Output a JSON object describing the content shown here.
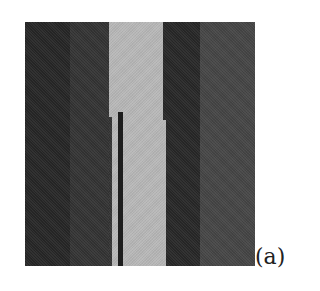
{
  "figure": {
    "label": "(a)",
    "regions": [
      {
        "name": "far-left-dark",
        "color": "#262626"
      },
      {
        "name": "left-dark",
        "color": "#333333"
      },
      {
        "name": "center-light",
        "color": "#b8b8b8"
      },
      {
        "name": "thin-bar",
        "color": "#1e1e1e"
      },
      {
        "name": "right-dark",
        "color": "#272727"
      },
      {
        "name": "far-right-medium",
        "color": "#454545"
      }
    ]
  }
}
